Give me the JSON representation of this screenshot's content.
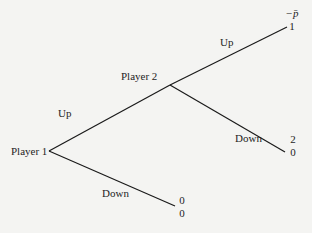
{
  "diagram": {
    "type": "extensive-form game tree",
    "nodes": {
      "player1": {
        "label": "Player 1"
      },
      "player2": {
        "label": "Player 2"
      }
    },
    "edges": {
      "p1_up": {
        "label": "Up"
      },
      "p1_down": {
        "label": "Down"
      },
      "p2_up": {
        "label": "Up"
      },
      "p2_down": {
        "label": "Down"
      }
    },
    "payoffs": {
      "p2_up": {
        "player1": "−p̄",
        "player2": "1"
      },
      "p2_down": {
        "player1": "2",
        "player2": "0"
      },
      "p1_down": {
        "player1": "0",
        "player2": "0"
      }
    },
    "colors": {
      "background": "#f4f4f2",
      "line": "#1a1a1a",
      "text": "#1e1e1e"
    }
  }
}
